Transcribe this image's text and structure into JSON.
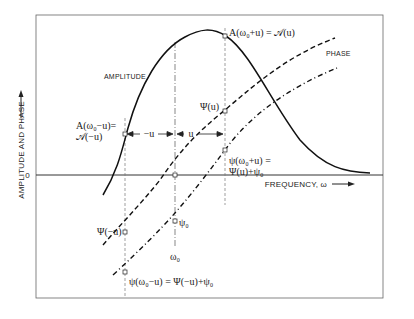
{
  "diagram": {
    "y_axis_label": "AMPLITUDE AND PHASE",
    "x_axis_label": "FREQUENCY, ω",
    "zero_label": "0",
    "curves": {
      "amplitude_label": "AMPLITUDE",
      "phase_label": "PHASE"
    },
    "annotations": {
      "amp_plus": "A(ω₀+u) = 𝒜(u)",
      "amp_minus_line1": "A(ω₀−u)=",
      "amp_minus_line2": "𝒜(−u)",
      "minus_u": "−u",
      "plus_u": "u",
      "psi_u": "Ψ(u)",
      "psi_plus_line1": "ψ(ω₀+u) =",
      "psi_plus_line2": "Ψ(u)+ψ₀",
      "psi_minus_u": "Ψ(−u)",
      "psi_0": "ψ₀",
      "omega_0": "ω₀",
      "psi_minus": "ψ(ω₀−u) = Ψ(−u)+ψ₀"
    },
    "colors": {
      "ink": "#222222",
      "frame": "#555555",
      "background": "#ffffff"
    }
  }
}
